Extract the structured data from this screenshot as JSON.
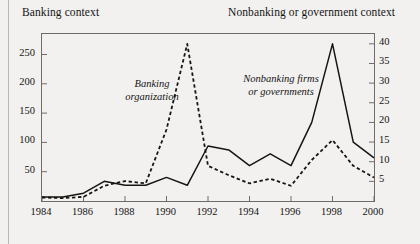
{
  "figure": {
    "header_left": "Banking context",
    "header_right": "Nonbanking or government context"
  },
  "annotations": {
    "left_line1": "Banking",
    "left_line2": "organization",
    "right_line1": "Nonbanking firms",
    "right_line2": "or governments"
  },
  "chart_data": {
    "type": "line",
    "title": "",
    "subtitle": "",
    "xlabel": "",
    "ylabel": "",
    "grid": false,
    "legend_position": "inline-annotations",
    "xlim": [
      1984,
      2000
    ],
    "x": [
      1984,
      1985,
      1986,
      1987,
      1988,
      1989,
      1990,
      1991,
      1992,
      1993,
      1994,
      1995,
      1996,
      1997,
      1998,
      1999,
      2000
    ],
    "xticks": [
      "1984",
      "1986",
      "1988",
      "1990",
      "1992",
      "1994",
      "1996",
      "1998",
      "2000"
    ],
    "xtick_values": [
      1984,
      1986,
      1988,
      1990,
      1992,
      1994,
      1996,
      1998,
      2000
    ],
    "left_axis": {
      "label": "",
      "ylim": [
        0,
        285
      ],
      "ticks": [
        50,
        100,
        150,
        200,
        250
      ],
      "ticklabels": [
        "50",
        "100",
        "150",
        "200",
        "250"
      ]
    },
    "right_axis": {
      "label": "",
      "ylim": [
        0,
        42.5
      ],
      "ticks": [
        5,
        10,
        15,
        20,
        25,
        30,
        35,
        40
      ],
      "ticklabels": [
        "5",
        "10",
        "15",
        "20",
        "25",
        "30",
        "35",
        "40"
      ]
    },
    "series": [
      {
        "name": "Banking organization",
        "axis": "left",
        "style": "dashed",
        "color": "#17150f",
        "values": [
          6,
          5,
          7,
          26,
          34,
          30,
          122,
          268,
          60,
          44,
          30,
          38,
          26,
          70,
          104,
          60,
          40
        ]
      },
      {
        "name": "Nonbanking firms or governments",
        "axis": "right",
        "style": "solid",
        "color": "#17150f",
        "values": [
          1,
          1,
          2,
          5,
          4,
          4,
          6,
          4,
          14,
          13,
          9,
          12,
          9,
          20,
          40,
          15,
          11
        ]
      }
    ]
  }
}
